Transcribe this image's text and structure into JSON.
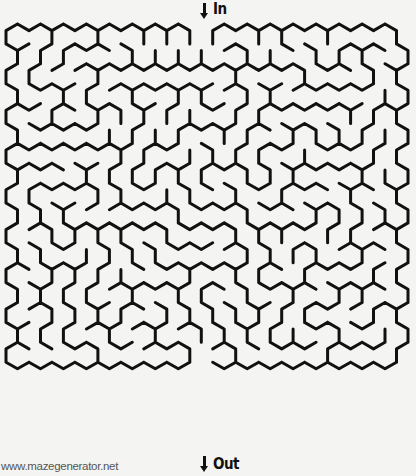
{
  "maze": {
    "type": "hexagonal",
    "cols": 17,
    "rows": 17,
    "origin_x": 6,
    "origin_y": 24,
    "width": 402,
    "height": 421,
    "wall_color": "#111111",
    "background_color": "#f4f4f2",
    "wall_width": 3,
    "entrance_col": 8,
    "exit_col": 8,
    "seed": 1337
  },
  "entrance": {
    "label": "In",
    "arrow_icon": "down-arrow"
  },
  "exit": {
    "label": "Out",
    "arrow_icon": "down-arrow"
  },
  "watermark": {
    "text": "www.mazegenerator.net"
  }
}
